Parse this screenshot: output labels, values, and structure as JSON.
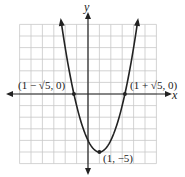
{
  "chart_data": {
    "type": "line",
    "title": "",
    "xlabel": "x",
    "ylabel": "y",
    "xlim": [
      -6,
      6
    ],
    "ylim": [
      -6,
      6
    ],
    "grid": true,
    "function": "y = (x - 1)^2 - 5",
    "series": [
      {
        "name": "parabola",
        "x": [
          -2.5,
          -2,
          -1.236,
          -1,
          0,
          1,
          2,
          3,
          3.236,
          4,
          4.5
        ],
        "y": [
          7.25,
          4,
          0,
          -1,
          -4,
          -5,
          -4,
          -1,
          0,
          4,
          7.25
        ]
      }
    ],
    "points": [
      {
        "label": "(1 − √5, 0)",
        "x": -1.236,
        "y": 0
      },
      {
        "label": "(1 + √5, 0)",
        "x": 3.236,
        "y": 0
      },
      {
        "label": "(1, −5)",
        "x": 1,
        "y": -5
      }
    ]
  },
  "labels": {
    "x_axis": "x",
    "y_axis": "y",
    "left_root": "(1 − √5, 0)",
    "right_root": "(1 + √5, 0)",
    "vertex": "(1, −5)"
  },
  "colors": {
    "grid": "#c8c8c8",
    "axis": "#222222",
    "curve": "#222222"
  }
}
